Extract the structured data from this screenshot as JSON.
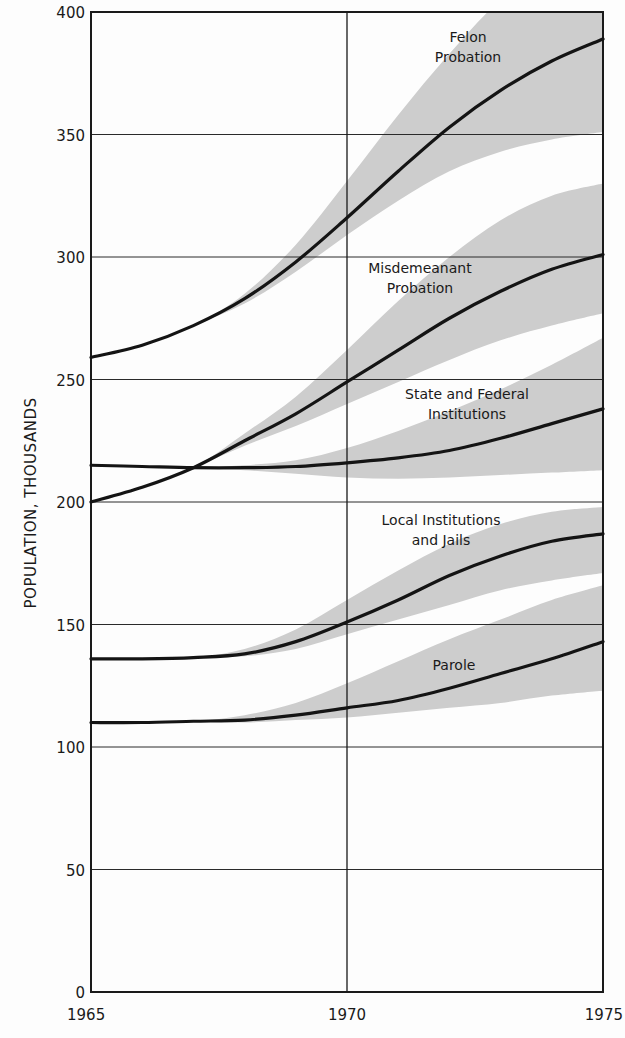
{
  "chart_data": {
    "type": "line",
    "title": "",
    "xlabel": "",
    "ylabel": "POPULATION, THOUSANDS",
    "xlim": [
      1965,
      1975
    ],
    "ylim": [
      0,
      400
    ],
    "x_ticks": [
      1965,
      1970,
      1975
    ],
    "y_ticks": [
      0,
      50,
      100,
      150,
      200,
      250,
      300,
      350,
      400
    ],
    "grid": {
      "horizontal": true,
      "vertical_at": [
        1970
      ]
    },
    "legend": "inline labels",
    "band_color": "#cdcdcd",
    "line_color": "#141414",
    "x": [
      1965,
      1966,
      1967,
      1968,
      1969,
      1970,
      1971,
      1972,
      1973,
      1974,
      1975
    ],
    "series": [
      {
        "name": "Felon Probation",
        "label_lines": [
          "Felon",
          "Probation"
        ],
        "label_pos": [
          468,
          42
        ],
        "values": [
          259,
          264,
          272,
          283,
          298,
          316,
          335,
          353,
          368,
          380,
          389
        ],
        "band_upper": [
          259,
          264,
          272,
          285,
          305,
          331,
          358,
          383,
          405,
          420,
          430
        ],
        "band_lower": [
          259,
          264,
          272,
          281,
          294,
          309,
          323,
          335,
          343,
          348,
          351
        ]
      },
      {
        "name": "Misdemeanant Probation",
        "label_lines": [
          "Misdemeanant",
          "Probation"
        ],
        "label_pos": [
          420,
          273
        ],
        "values": [
          200,
          206,
          214,
          225,
          236,
          249,
          262,
          275,
          286,
          295,
          301
        ],
        "band_upper": [
          200,
          206,
          214,
          228,
          243,
          262,
          282,
          300,
          315,
          325,
          330
        ],
        "band_lower": [
          200,
          206,
          214,
          223,
          231,
          240,
          249,
          258,
          266,
          272,
          277
        ]
      },
      {
        "name": "State and Federal Institutions",
        "label_lines": [
          "State and Federal",
          "Institutions"
        ],
        "label_pos": [
          467,
          399
        ],
        "values": [
          215,
          214.5,
          214,
          214,
          214.5,
          216,
          218,
          221,
          226,
          232,
          238
        ],
        "band_upper": [
          215,
          214.5,
          214,
          215,
          217,
          222,
          229,
          237,
          246,
          256,
          267
        ],
        "band_lower": [
          215,
          214.5,
          214,
          213,
          211.5,
          210,
          209.5,
          210,
          211,
          212,
          213
        ]
      },
      {
        "name": "Local Institutions and Jails",
        "label_lines": [
          "Local Institutions",
          "and Jails"
        ],
        "label_pos": [
          441,
          525
        ],
        "values": [
          136,
          136,
          136.5,
          138,
          143,
          151,
          160,
          170,
          178,
          184,
          187
        ],
        "band_upper": [
          136,
          136,
          136.5,
          140,
          148,
          160,
          172,
          183,
          191,
          196,
          198
        ],
        "band_lower": [
          136,
          136,
          136.5,
          137,
          140,
          146,
          152,
          158,
          164,
          168,
          171
        ]
      },
      {
        "name": "Parole",
        "label_lines": [
          "Parole"
        ],
        "label_pos": [
          454,
          670
        ],
        "values": [
          110,
          110,
          110.5,
          111,
          113,
          116,
          119,
          124,
          130,
          136,
          143
        ],
        "band_upper": [
          110,
          110,
          110.5,
          113,
          118,
          126,
          135,
          144,
          152,
          160,
          166
        ],
        "band_lower": [
          110,
          110,
          110.5,
          110,
          111,
          112,
          114,
          116,
          118,
          121,
          123
        ]
      }
    ]
  }
}
